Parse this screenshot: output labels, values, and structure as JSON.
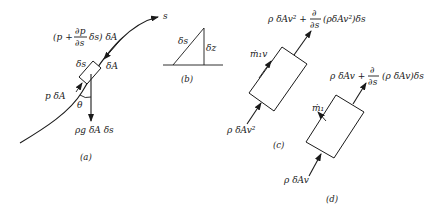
{
  "figure": {
    "panel_a": {
      "caption": "(a)",
      "curve_label": "s",
      "top_force_prefix": "(p +",
      "top_force_frac_num": "∂p",
      "top_force_frac_den": "∂s",
      "top_force_suffix": "δs) δA",
      "element_length_label": "δs",
      "element_area_label": "δA",
      "bottom_force_label": "p δA",
      "angle_label": "θ",
      "weight_label": "ρg δA δs"
    },
    "panel_b": {
      "caption": "(b)",
      "hypotenuse_label": "δs",
      "vertical_label": "δz"
    },
    "panel_c": {
      "caption": "(c)",
      "outflow_prefix": "ρ δAv² +",
      "outflow_frac_num": "∂",
      "outflow_frac_den": "∂s",
      "outflow_suffix": "(ρδAv²)δs",
      "side_inflow_label": "ṁ₁v",
      "inflow_label": "ρ δAv²"
    },
    "panel_d": {
      "caption": "(d)",
      "outflow_prefix": "ρ δAv +",
      "outflow_frac_num": "∂",
      "outflow_frac_den": "∂s",
      "outflow_suffix": "(ρ δAv)δs",
      "side_inflow_label": "ṁ₁",
      "inflow_label": "ρ δAv"
    }
  }
}
